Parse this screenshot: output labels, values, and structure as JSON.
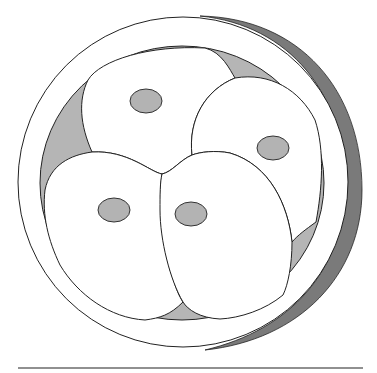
{
  "diagram": {
    "colors": {
      "background": "#ffffff",
      "outline": "#222222",
      "zona_shadow": "#7a7a7a",
      "perivitelline_space": "#b5b5b5",
      "blastomere_fill": "#ffffff",
      "nucleus_fill": "#b3b3b3",
      "baseline": "#222222"
    },
    "zona": {
      "cx": 184,
      "cy": 180,
      "r": 167
    },
    "blastomere_count": 4,
    "nuclei": [
      {
        "cx": 146,
        "cy": 101,
        "rx": 16,
        "ry": 12
      },
      {
        "cx": 273,
        "cy": 148,
        "rx": 16,
        "ry": 12
      },
      {
        "cx": 114,
        "cy": 210,
        "rx": 16,
        "ry": 12
      },
      {
        "cx": 191,
        "cy": 214,
        "rx": 16,
        "ry": 12
      }
    ],
    "baseline": {
      "x1": 18,
      "x2": 363,
      "y": 368
    }
  }
}
